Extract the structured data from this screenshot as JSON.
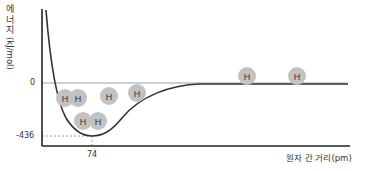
{
  "chart_data": {
    "type": "line",
    "title": "",
    "ylabel": "에너지 (kJ/mol)",
    "ylabel_korean": "에너지",
    "ylabel_unit": "(kJ/mol)",
    "xlabel": "원자 간 거리(pm)",
    "y_ticks": [
      "0",
      "-436"
    ],
    "x_ticks": [
      "74"
    ],
    "min_point": {
      "x": 74,
      "y": -436
    },
    "ylim": [
      -500,
      200
    ],
    "grid": false,
    "legend": null,
    "series": [
      {
        "name": "H2 potential energy curve",
        "description": "Energy vs internuclear distance: steep rise at short distance, minimum of -436 kJ/mol at 74 pm, approaching 0 at large distance"
      }
    ],
    "annotations": [
      {
        "type": "atom-pair",
        "label": [
          "H",
          "H"
        ],
        "state": "overlapping (short distance)"
      },
      {
        "type": "atom-pair",
        "label": [
          "H",
          "H"
        ],
        "state": "bond length at energy minimum"
      },
      {
        "type": "atom-pair",
        "label": [
          "H",
          "H"
        ],
        "state": "approaching"
      },
      {
        "type": "atom-pair",
        "label": [
          "H",
          "H"
        ],
        "state": "far apart, energy 0"
      }
    ]
  },
  "labels": {
    "y_korean": "에너지",
    "y_unit": "(kJ/mol)",
    "zero": "0",
    "min_energy": "-436",
    "bond_length": "74",
    "x_axis": "원자 간 거리(pm)",
    "atom": "H"
  },
  "colors": {
    "axis": "#222222",
    "curve": "#333333",
    "zero_line": "#999999",
    "atom_fill": "#c2c2c2",
    "dashed": "#888888"
  }
}
